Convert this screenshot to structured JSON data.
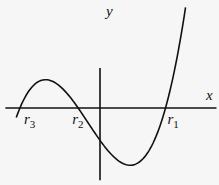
{
  "chart_data": {
    "type": "line",
    "title": "",
    "xlabel": "x",
    "ylabel": "y",
    "grid": false,
    "xlim": [
      -5.2,
      6.4
    ],
    "ylim": [
      -4.2,
      5.5
    ],
    "roots": [
      {
        "name": "r1",
        "base": "r",
        "sub": "1",
        "x": 3.6
      },
      {
        "name": "r2",
        "base": "r",
        "sub": "2",
        "x": -1.2
      },
      {
        "name": "r3",
        "base": "r",
        "sub": "3",
        "x": -4.4
      }
    ],
    "curve": {
      "form": "y = k (x - r1)(x - r2)(x - r3)",
      "k": 0.0917,
      "x_range": [
        -4.6,
        4.7
      ]
    }
  },
  "axes": {
    "x_label": "x",
    "y_label": "y"
  }
}
